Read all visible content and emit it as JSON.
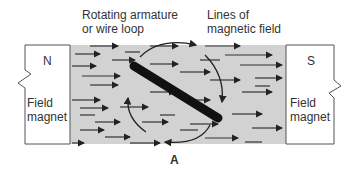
{
  "labels": {
    "armature_line1": "Rotating armature",
    "armature_line2": "or wire loop",
    "field_line1": "Lines of",
    "field_line2": "magnetic field",
    "north": "N",
    "south": "S",
    "left_magnet_line1": "Field",
    "left_magnet_line2": "magnet",
    "right_magnet_line1": "Field",
    "right_magnet_line2": "magnet",
    "caption": "A"
  },
  "colors": {
    "field_fill": "#d2d2d2",
    "armature": "#111111",
    "line": "#222222"
  }
}
